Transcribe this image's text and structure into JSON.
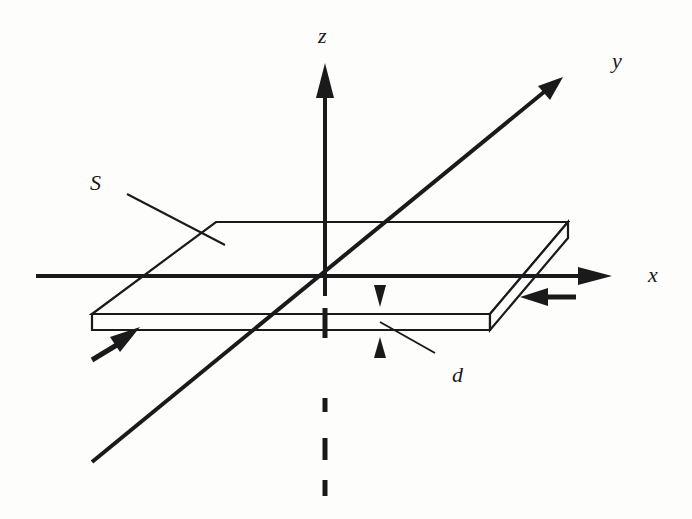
{
  "figure": {
    "labels": {
      "z": "z",
      "y": "y",
      "x": "x",
      "S": "S",
      "d": "d"
    },
    "colors": {
      "stroke": "#1a1a1a",
      "background": "#fdfdfc"
    }
  }
}
